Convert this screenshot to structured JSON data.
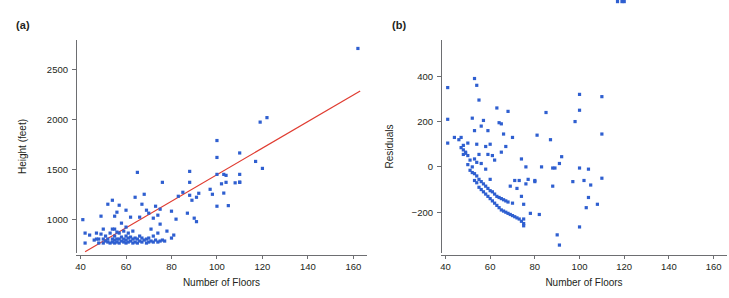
{
  "figure": {
    "background": "#ffffff",
    "point_color": "#2f5fd0",
    "line_color": "#e03c31",
    "axis_color": "#6d6e71",
    "width": 729,
    "height": 298
  },
  "panels": [
    {
      "id": "a",
      "label": "(a)"
    },
    {
      "id": "b",
      "label": "(b)"
    }
  ],
  "chart_data": [
    {
      "type": "scatter",
      "panel": "(a)",
      "title": "",
      "xlabel": "Number of Floors",
      "ylabel": "Height (feet)",
      "xlim": [
        38,
        166
      ],
      "ylim": [
        660,
        2800
      ],
      "xticks": [
        40,
        60,
        80,
        100,
        120,
        140,
        160
      ],
      "xticklabels": [
        "40",
        "60",
        "80",
        "100",
        "120",
        "140",
        "160"
      ],
      "yticks": [
        1000,
        1500,
        2000,
        2500
      ],
      "yticklabels": [
        "1000",
        "1500",
        "2000",
        "2500"
      ],
      "grid": false,
      "legend": null,
      "fit_line": {
        "label": "least-squares regression line",
        "color": "#e03c31",
        "x": [
          42,
          163
        ],
        "y": [
          672,
          2288
        ]
      },
      "x": [
        41,
        42,
        42,
        44,
        46,
        47,
        47,
        48,
        48,
        49,
        49,
        50,
        50,
        50,
        51,
        51,
        52,
        52,
        52,
        53,
        53,
        54,
        54,
        54,
        54,
        55,
        55,
        55,
        55,
        55,
        56,
        56,
        56,
        56,
        57,
        57,
        57,
        57,
        58,
        58,
        58,
        59,
        59,
        59,
        60,
        60,
        60,
        60,
        60,
        61,
        61,
        61,
        62,
        62,
        62,
        63,
        63,
        63,
        64,
        64,
        64,
        65,
        65,
        65,
        66,
        66,
        66,
        67,
        67,
        67,
        68,
        68,
        69,
        69,
        69,
        70,
        70,
        70,
        71,
        71,
        72,
        72,
        72,
        73,
        73,
        74,
        74,
        74,
        75,
        75,
        75,
        76,
        76,
        77,
        78,
        80,
        80,
        81,
        82,
        83,
        85,
        87,
        88,
        88,
        88,
        89,
        90,
        91,
        91,
        92,
        97,
        98,
        100,
        100,
        100,
        100,
        102,
        103,
        103,
        104,
        104,
        105,
        108,
        110,
        110,
        110,
        110,
        117,
        119,
        120,
        122,
        162
      ],
      "y": [
        995,
        860,
        760,
        840,
        790,
        800,
        860,
        760,
        800,
        850,
        1030,
        760,
        800,
        900,
        780,
        830,
        770,
        800,
        1150,
        760,
        860,
        770,
        800,
        900,
        1190,
        760,
        790,
        830,
        900,
        1030,
        770,
        800,
        870,
        1070,
        760,
        800,
        860,
        1140,
        780,
        820,
        960,
        770,
        800,
        880,
        760,
        790,
        830,
        920,
        1090,
        770,
        810,
        860,
        780,
        820,
        1020,
        760,
        800,
        880,
        770,
        810,
        1220,
        760,
        800,
        1470,
        780,
        830,
        1020,
        770,
        810,
        1150,
        790,
        1250,
        760,
        800,
        1090,
        770,
        810,
        1060,
        780,
        900,
        770,
        830,
        1010,
        790,
        1130,
        770,
        860,
        1040,
        780,
        950,
        1100,
        790,
        1370,
        780,
        880,
        810,
        1080,
        840,
        1000,
        1230,
        1270,
        1060,
        1240,
        1370,
        1480,
        1190,
        1010,
        975,
        1220,
        1260,
        1300,
        1250,
        1130,
        1450,
        1620,
        1790,
        1355,
        1450,
        1262,
        1370,
        1440,
        1136,
        1365,
        1665,
        1450,
        1370,
        1372,
        1580,
        1975,
        1510,
        2020,
        2715
      ],
      "n_points": 133
    },
    {
      "type": "scatter",
      "panel": "(b)",
      "title": "",
      "xlabel": "Number of Floors",
      "ylabel": "Residuals",
      "xlim": [
        38,
        166
      ],
      "ylim": [
        -380,
        560
      ],
      "xticks": [
        40,
        60,
        80,
        100,
        120,
        140,
        160
      ],
      "xticklabels": [
        "40",
        "60",
        "80",
        "100",
        "120",
        "140",
        "160"
      ],
      "yticks": [
        -200,
        0,
        200,
        400
      ],
      "yticklabels": [
        "−200",
        "0",
        "200",
        "400"
      ],
      "grid": false,
      "legend": null,
      "fit_line": null,
      "x": [
        41,
        41,
        41,
        44,
        46,
        47,
        47,
        48,
        48,
        48,
        49,
        49,
        50,
        50,
        50,
        51,
        51,
        52,
        52,
        52,
        53,
        53,
        53,
        53,
        53,
        54,
        54,
        54,
        54,
        54,
        55,
        55,
        55,
        55,
        56,
        56,
        56,
        56,
        57,
        57,
        57,
        58,
        58,
        58,
        58,
        59,
        59,
        59,
        59,
        60,
        60,
        60,
        60,
        61,
        61,
        61,
        62,
        62,
        62,
        63,
        63,
        63,
        64,
        64,
        64,
        65,
        65,
        65,
        65,
        66,
        66,
        66,
        67,
        67,
        67,
        68,
        68,
        68,
        69,
        69,
        70,
        70,
        70,
        71,
        71,
        72,
        72,
        73,
        73,
        74,
        74,
        74,
        75,
        75,
        75,
        75,
        76,
        76,
        77,
        78,
        80,
        80,
        81,
        82,
        83,
        85,
        87,
        88,
        88,
        89,
        90,
        91,
        91,
        92,
        97,
        98,
        100,
        100,
        100,
        100,
        102,
        103,
        104,
        104,
        105,
        108,
        110,
        110,
        110,
        117,
        119,
        120
      ],
      "y": [
        350,
        210,
        105,
        130,
        120,
        85,
        130,
        55,
        75,
        95,
        60,
        65,
        10,
        50,
        105,
        -15,
        30,
        -25,
        0,
        215,
        -60,
        -30,
        35,
        160,
        390,
        -70,
        -40,
        20,
        100,
        360,
        -90,
        -55,
        55,
        295,
        -100,
        -65,
        15,
        180,
        -110,
        -75,
        205,
        -120,
        -85,
        -10,
        90,
        -130,
        -95,
        55,
        160,
        -140,
        -105,
        -55,
        100,
        -150,
        -110,
        50,
        -160,
        -120,
        30,
        -170,
        -130,
        260,
        -180,
        -135,
        195,
        -190,
        -140,
        65,
        190,
        -195,
        -145,
        145,
        -200,
        -150,
        90,
        -205,
        -155,
        245,
        -210,
        -85,
        -215,
        -160,
        130,
        -220,
        -60,
        -225,
        -95,
        -230,
        -60,
        -240,
        -130,
        35,
        -250,
        -165,
        -230,
        -260,
        -75,
        0,
        -55,
        -205,
        -65,
        -60,
        140,
        -210,
        0,
        240,
        120,
        -5,
        -85,
        -5,
        -300,
        -345,
        15,
        45,
        -65,
        200,
        250,
        -265,
        -5,
        320,
        -60,
        -180,
        -10,
        -135,
        -80,
        -165,
        145,
        -50,
        310
      ],
      "n_points": 132
    }
  ]
}
